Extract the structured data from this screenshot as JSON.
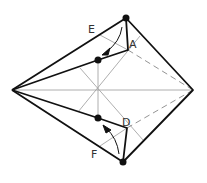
{
  "diagram": {
    "type": "origami-fold-step",
    "labels": {
      "E": "E",
      "A": "A",
      "D": "D",
      "F": "F"
    },
    "colors": {
      "line": "#111111",
      "crease": "#999999",
      "dot": "#111111",
      "background": "#ffffff"
    },
    "points": {
      "left": [
        12,
        90
      ],
      "right": [
        193,
        90
      ],
      "top_dot": [
        126,
        18
      ],
      "bottom_dot": [
        123,
        162
      ],
      "upper_inner_dot": [
        98,
        60
      ],
      "lower_inner_dot": [
        98,
        118
      ],
      "corner_A": [
        128,
        50
      ],
      "corner_D": [
        127,
        128
      ],
      "center": [
        98,
        90
      ]
    }
  }
}
